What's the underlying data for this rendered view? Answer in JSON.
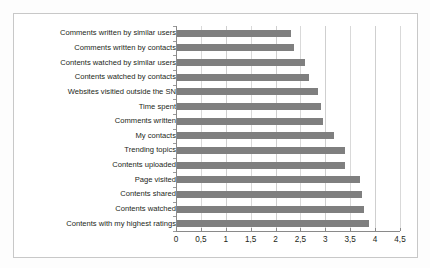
{
  "chart_data": {
    "type": "bar",
    "orientation": "horizontal",
    "title": "",
    "subtitle": "",
    "xlabel": "",
    "ylabel": "",
    "xlim": [
      0,
      4.5
    ],
    "grid": true,
    "legend": null,
    "decimal_separator": ",",
    "bar_color": "#7f7f7f",
    "categories": [
      "Comments written by similar users",
      "Comments written by contacts",
      "Contents watched by similar users",
      "Contents watched by contacts",
      "Websites visitied outside the SN",
      "Time spent",
      "Comments written",
      "My contacts",
      "Trending topics",
      "Contents uploaded",
      "Page visited",
      "Contents shared",
      "Contents watched",
      "Contents with my highest ratings"
    ],
    "values": [
      2.3,
      2.35,
      2.58,
      2.65,
      2.83,
      2.9,
      2.93,
      3.15,
      3.37,
      3.37,
      3.67,
      3.72,
      3.75,
      3.85
    ],
    "xticks": [
      0,
      0.5,
      1,
      1.5,
      2,
      2.5,
      3,
      3.5,
      4,
      4.5
    ],
    "xtick_labels": [
      "0",
      "0,5",
      "1",
      "1,5",
      "2",
      "2,5",
      "3",
      "3,5",
      "4",
      "4,5"
    ]
  }
}
